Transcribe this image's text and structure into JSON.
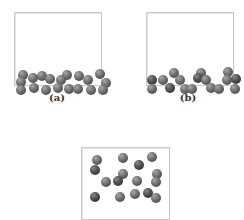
{
  "figure": {
    "panels": [
      {
        "id": "a",
        "label": "(a)",
        "box": {
          "x": 14,
          "y": 12,
          "w": 88,
          "h": 74
        },
        "label_pos": {
          "x": 57,
          "y": 92
        },
        "balls": [
          [
            3,
            57,
            0
          ],
          [
            22,
            58,
            0
          ],
          [
            47,
            57,
            0
          ],
          [
            59,
            58,
            0
          ],
          [
            80,
            56,
            0
          ],
          [
            1,
            64,
            0
          ],
          [
            13,
            60,
            0
          ],
          [
            30,
            61,
            0
          ],
          [
            41,
            62,
            0
          ],
          [
            68,
            62,
            0
          ],
          [
            86,
            65,
            0
          ],
          [
            1,
            72,
            0
          ],
          [
            14,
            70,
            0
          ],
          [
            26,
            72,
            0
          ],
          [
            38,
            70,
            0
          ],
          [
            49,
            71,
            0
          ],
          [
            58,
            71,
            0
          ],
          [
            71,
            72,
            0
          ],
          [
            83,
            72,
            0
          ]
        ]
      },
      {
        "id": "b",
        "label": "(b)",
        "box": {
          "x": 146,
          "y": 12,
          "w": 88,
          "h": 74
        },
        "label_pos": {
          "x": 188,
          "y": 92
        },
        "balls": [
          [
            22,
            55,
            0
          ],
          [
            49,
            55,
            0
          ],
          [
            76,
            54,
            0
          ],
          [
            0,
            62,
            1
          ],
          [
            11,
            62,
            0
          ],
          [
            28,
            62,
            0
          ],
          [
            46,
            60,
            1
          ],
          [
            54,
            62,
            0
          ],
          [
            75,
            62,
            0
          ],
          [
            84,
            61,
            1
          ],
          [
            0,
            71,
            0
          ],
          [
            18,
            70,
            1
          ],
          [
            33,
            71,
            0
          ],
          [
            40,
            71,
            0
          ],
          [
            59,
            70,
            0
          ],
          [
            67,
            71,
            0
          ],
          [
            83,
            71,
            0
          ]
        ]
      },
      {
        "id": "c",
        "label": "",
        "box": {
          "x": 81,
          "y": 147,
          "w": 89,
          "h": 73
        },
        "balls": [
          [
            10,
            7,
            0
          ],
          [
            36,
            5,
            0
          ],
          [
            65,
            4,
            0
          ],
          [
            8,
            17,
            1
          ],
          [
            36,
            21,
            0
          ],
          [
            52,
            12,
            1
          ],
          [
            70,
            21,
            0
          ],
          [
            19,
            29,
            0
          ],
          [
            31,
            28,
            1
          ],
          [
            50,
            28,
            0
          ],
          [
            69,
            29,
            0
          ],
          [
            48,
            41,
            0
          ],
          [
            8,
            44,
            1
          ],
          [
            33,
            44,
            0
          ],
          [
            61,
            40,
            1
          ],
          [
            69,
            45,
            0
          ]
        ]
      }
    ]
  }
}
